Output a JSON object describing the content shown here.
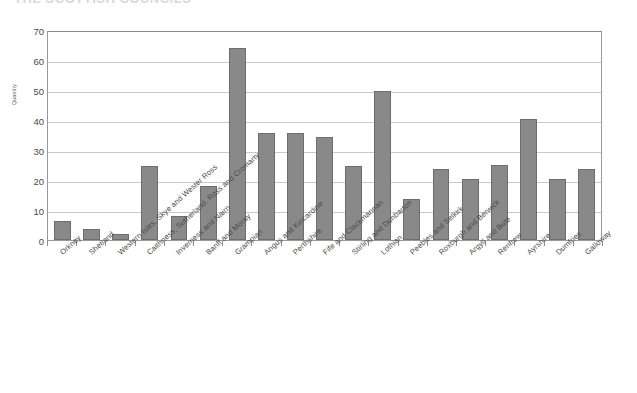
{
  "title_sliver": "THE SCOTTISH COUNCILS",
  "chart_data": {
    "type": "bar",
    "title": "",
    "xlabel": "",
    "ylabel": "Quantity",
    "ylim": [
      0,
      70
    ],
    "ytick_values": [
      0,
      10,
      20,
      30,
      40,
      50,
      60,
      70
    ],
    "ytick_labels": [
      "0",
      "10",
      "20",
      "30",
      "40",
      "50",
      "60",
      "70"
    ],
    "grid": true,
    "legend": "none",
    "bar_color": "#898989",
    "bar_border_color": "#6d6d6d",
    "gridline_color": "#c9c9c9",
    "axis_color": "#9a9a9a",
    "categories": [
      "Orkney",
      "Shetland",
      "Western Isles, Skye and Wester Ross",
      "Caithness, Sutherland, Ross and Cromarty",
      "Inverness and Nairn",
      "Banff and Moray",
      "Grampian",
      "Angus and Kincardine",
      "Perthshire",
      "Fife and Clackmannan",
      "Stirling and Dunbarton",
      "Lothian",
      "Peebles and Selkirk",
      "Roxburgh and Berwick",
      "Argyll and Bute",
      "Renfrew",
      "Ayrshire",
      "Dumfries",
      "Galloway"
    ],
    "values": [
      6.3,
      3.6,
      1.9,
      24.6,
      8.1,
      17.9,
      64.0,
      35.8,
      35.7,
      34.4,
      24.8,
      49.8,
      13.8,
      23.8,
      20.2,
      24.9,
      40.4,
      20.2,
      23.8
    ]
  }
}
